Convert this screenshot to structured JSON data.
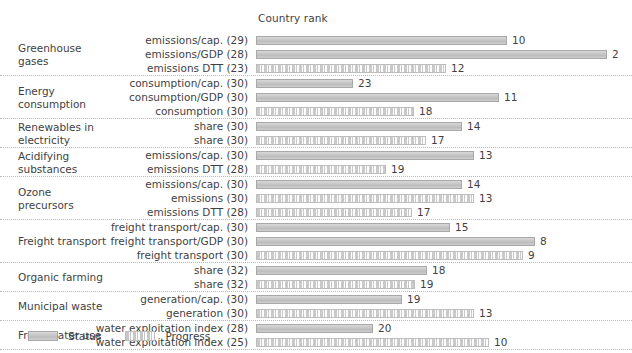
{
  "chart_data": {
    "type": "bar",
    "title": "Country rank",
    "xlabel": "",
    "ylabel": "",
    "orientation": "horizontal",
    "grid": false,
    "legend_position": "bottom-left",
    "legend": [
      {
        "key": "status",
        "label": "Status"
      },
      {
        "key": "progress",
        "label": "Progress"
      }
    ],
    "groups": [
      {
        "name": "Greenhouse\ngases",
        "rows": [
          {
            "indicator": "emissions/cap. (29)",
            "total": 29,
            "rank": 10,
            "series": "status",
            "value": 10
          },
          {
            "indicator": "emissions/GDP (28)",
            "total": 28,
            "rank": 2,
            "series": "status",
            "value": 2
          },
          {
            "indicator": "emissions DTT (23)",
            "total": 23,
            "rank": 12,
            "series": "progress",
            "value": 12
          }
        ]
      },
      {
        "name": "Energy\nconsumption",
        "rows": [
          {
            "indicator": "consumption/cap. (30)",
            "total": 30,
            "rank": 23,
            "series": "status",
            "value": 23
          },
          {
            "indicator": "consumption/GDP (30)",
            "total": 30,
            "rank": 11,
            "series": "status",
            "value": 11
          },
          {
            "indicator": "consumption (30)",
            "total": 30,
            "rank": 18,
            "series": "progress",
            "value": 18
          }
        ]
      },
      {
        "name": "Renewables in\nelectricity",
        "rows": [
          {
            "indicator": "share (30)",
            "total": 30,
            "rank": 14,
            "series": "status",
            "value": 14
          },
          {
            "indicator": "share (30)",
            "total": 30,
            "rank": 17,
            "series": "progress",
            "value": 17
          }
        ]
      },
      {
        "name": "Acidifying\nsubstances",
        "rows": [
          {
            "indicator": "emissions/cap. (30)",
            "total": 30,
            "rank": 13,
            "series": "status",
            "value": 13
          },
          {
            "indicator": "emissions DTT (28)",
            "total": 28,
            "rank": 19,
            "series": "progress",
            "value": 19
          }
        ]
      },
      {
        "name": "Ozone\nprecursors",
        "rows": [
          {
            "indicator": "emissions/cap. (30)",
            "total": 30,
            "rank": 14,
            "series": "status",
            "value": 14
          },
          {
            "indicator": "emissions (30)",
            "total": 30,
            "rank": 13,
            "series": "progress",
            "value": 13
          },
          {
            "indicator": "emissions DTT (28)",
            "total": 28,
            "rank": 17,
            "series": "progress",
            "value": 17
          }
        ]
      },
      {
        "name": "Freight transport",
        "rows": [
          {
            "indicator": "freight transport/cap. (30)",
            "total": 30,
            "rank": 15,
            "series": "status",
            "value": 15
          },
          {
            "indicator": "freight transport/GDP (30)",
            "total": 30,
            "rank": 8,
            "series": "status",
            "value": 8
          },
          {
            "indicator": "freight transport (30)",
            "total": 30,
            "rank": 9,
            "series": "progress",
            "value": 9
          }
        ]
      },
      {
        "name": "Organic farming",
        "rows": [
          {
            "indicator": "share (32)",
            "total": 32,
            "rank": 18,
            "series": "status",
            "value": 18
          },
          {
            "indicator": "share (32)",
            "total": 32,
            "rank": 19,
            "series": "progress",
            "value": 19
          }
        ]
      },
      {
        "name": "Municipal waste",
        "rows": [
          {
            "indicator": "generation/cap. (30)",
            "total": 30,
            "rank": 19,
            "series": "status",
            "value": 19
          },
          {
            "indicator": "generation (30)",
            "total": 30,
            "rank": 13,
            "series": "progress",
            "value": 13
          }
        ]
      },
      {
        "name": "Fresh water use",
        "rows": [
          {
            "indicator": "water exploitation index (28)",
            "total": 28,
            "rank": 20,
            "series": "status",
            "value": 20
          },
          {
            "indicator": "water exploitation index (25)",
            "total": 25,
            "rank": 10,
            "series": "progress",
            "value": 10
          }
        ]
      }
    ]
  },
  "colors": {
    "status_fill": "#c9c9c9",
    "status_border": "#a8a8a8",
    "progress_fill": "#c6c6c6",
    "progress_border": "#bdbdbd",
    "separator": "#b9b9b9",
    "text": "#3f3f3f"
  }
}
